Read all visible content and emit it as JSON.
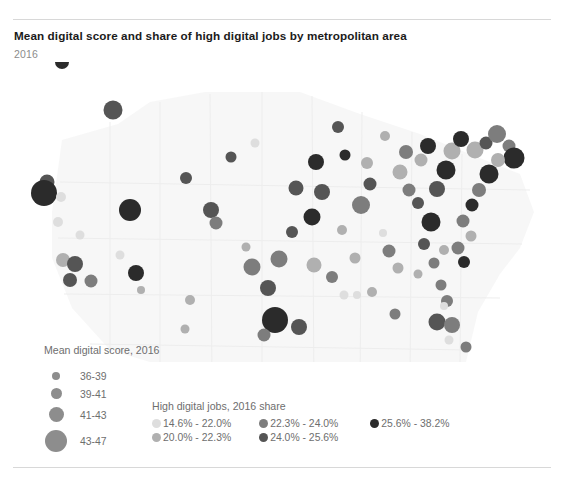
{
  "header": {
    "title": "Mean digital score and share of high digital jobs by metropolitan area",
    "subtitle": "2016"
  },
  "size_legend": {
    "title": "Mean digital score, 2016",
    "items": [
      {
        "label": "36-39",
        "radius": 4.0
      },
      {
        "label": "39-41",
        "radius": 5.5
      },
      {
        "label": "41-43",
        "radius": 7.5
      },
      {
        "label": "43-47",
        "radius": 11.0
      }
    ],
    "swatch_color": "#8d8d8d"
  },
  "color_legend": {
    "title": "High digital jobs, 2016 share",
    "columns": [
      [
        {
          "label": "14.6% - 22.0%",
          "color": "#dedede"
        },
        {
          "label": "20.0% - 22.3%",
          "color": "#b0b0b0"
        }
      ],
      [
        {
          "label": "22.3% - 24.0%",
          "color": "#7d7d7d"
        },
        {
          "label": "24.0% - 25.6%",
          "color": "#555555"
        }
      ],
      [
        {
          "label": "25.6% - 38.2%",
          "color": "#2b2b2b"
        }
      ]
    ]
  },
  "chart_data": {
    "type": "scatter",
    "title": "Mean digital score and share of high digital jobs by metropolitan area",
    "subtitle": "2016",
    "xlabel": "",
    "ylabel": "",
    "grid": false,
    "legend_position": "bottom",
    "projection": "united-states-albers",
    "size_variable": "Mean digital score, 2016",
    "size_bins": [
      "36-39",
      "39-41",
      "41-43",
      "43-47"
    ],
    "color_variable": "High digital jobs, 2016 share",
    "color_bins": [
      "14.6% - 22.0%",
      "20.0% - 22.3%",
      "22.3% - 24.0%",
      "24.0% - 25.6%",
      "25.6% - 38.2%"
    ],
    "color_palette": [
      "#dedede",
      "#b0b0b0",
      "#7d7d7d",
      "#555555",
      "#2b2b2b"
    ],
    "basemap_color": "#f4f4f4",
    "points": [
      {
        "x": 75,
        "y": 36,
        "r": 10.5,
        "c": 4
      },
      {
        "x": 62,
        "y": 62,
        "r": 7.0,
        "c": 4
      },
      {
        "x": 118,
        "y": 45,
        "r": 6.0,
        "c": 0
      },
      {
        "x": 113,
        "y": 110,
        "r": 9.5,
        "c": 3
      },
      {
        "x": 47,
        "y": 182,
        "r": 7.5,
        "c": 3
      },
      {
        "x": 44,
        "y": 193,
        "r": 13.0,
        "c": 4
      },
      {
        "x": 61,
        "y": 197,
        "r": 5.0,
        "c": 0
      },
      {
        "x": 58,
        "y": 222,
        "r": 5.0,
        "c": 0
      },
      {
        "x": 80,
        "y": 235,
        "r": 4.5,
        "c": 0
      },
      {
        "x": 63,
        "y": 260,
        "r": 7.0,
        "c": 1
      },
      {
        "x": 75,
        "y": 264,
        "r": 8.0,
        "c": 3
      },
      {
        "x": 70,
        "y": 280,
        "r": 7.0,
        "c": 3
      },
      {
        "x": 91,
        "y": 281,
        "r": 6.5,
        "c": 2
      },
      {
        "x": 130,
        "y": 210,
        "r": 11.0,
        "c": 4
      },
      {
        "x": 136,
        "y": 273,
        "r": 8.0,
        "c": 4
      },
      {
        "x": 120,
        "y": 255,
        "r": 4.5,
        "c": 0
      },
      {
        "x": 141,
        "y": 290,
        "r": 4.0,
        "c": 1
      },
      {
        "x": 186,
        "y": 178,
        "r": 6.0,
        "c": 3
      },
      {
        "x": 190,
        "y": 300,
        "r": 5.0,
        "c": 1
      },
      {
        "x": 211,
        "y": 210,
        "r": 8.0,
        "c": 3
      },
      {
        "x": 216,
        "y": 223,
        "r": 6.5,
        "c": 2
      },
      {
        "x": 185,
        "y": 329,
        "r": 4.5,
        "c": 1
      },
      {
        "x": 246,
        "y": 247,
        "r": 4.5,
        "c": 1
      },
      {
        "x": 252,
        "y": 267,
        "r": 8.5,
        "c": 2
      },
      {
        "x": 279,
        "y": 259,
        "r": 8.5,
        "c": 2
      },
      {
        "x": 268,
        "y": 288,
        "r": 8.0,
        "c": 3
      },
      {
        "x": 275,
        "y": 320,
        "r": 13.0,
        "c": 4
      },
      {
        "x": 264,
        "y": 335,
        "r": 6.5,
        "c": 2
      },
      {
        "x": 299,
        "y": 327,
        "r": 8.0,
        "c": 3
      },
      {
        "x": 292,
        "y": 232,
        "r": 6.0,
        "c": 3
      },
      {
        "x": 316,
        "y": 162,
        "r": 8.0,
        "c": 4
      },
      {
        "x": 296,
        "y": 188,
        "r": 7.5,
        "c": 3
      },
      {
        "x": 322,
        "y": 192,
        "r": 8.0,
        "c": 3
      },
      {
        "x": 312,
        "y": 217,
        "r": 8.5,
        "c": 4
      },
      {
        "x": 332,
        "y": 277,
        "r": 6.0,
        "c": 2
      },
      {
        "x": 344,
        "y": 295,
        "r": 4.5,
        "c": 0
      },
      {
        "x": 357,
        "y": 295,
        "r": 4.0,
        "c": 0
      },
      {
        "x": 314,
        "y": 265,
        "r": 7.5,
        "c": 1
      },
      {
        "x": 345,
        "y": 155,
        "r": 5.5,
        "c": 4
      },
      {
        "x": 342,
        "y": 230,
        "r": 5.0,
        "c": 1
      },
      {
        "x": 361,
        "y": 205,
        "r": 9.0,
        "c": 2
      },
      {
        "x": 370,
        "y": 184,
        "r": 6.5,
        "c": 3
      },
      {
        "x": 367,
        "y": 163,
        "r": 6.0,
        "c": 1
      },
      {
        "x": 383,
        "y": 233,
        "r": 4.0,
        "c": 0
      },
      {
        "x": 389,
        "y": 251,
        "r": 6.5,
        "c": 2
      },
      {
        "x": 398,
        "y": 268,
        "r": 5.5,
        "c": 1
      },
      {
        "x": 372,
        "y": 292,
        "r": 5.0,
        "c": 1
      },
      {
        "x": 395,
        "y": 314,
        "r": 5.5,
        "c": 2
      },
      {
        "x": 400,
        "y": 172,
        "r": 7.5,
        "c": 1
      },
      {
        "x": 409,
        "y": 190,
        "r": 6.5,
        "c": 2
      },
      {
        "x": 406,
        "y": 152,
        "r": 7.0,
        "c": 2
      },
      {
        "x": 421,
        "y": 160,
        "r": 6.5,
        "c": 1
      },
      {
        "x": 428,
        "y": 146,
        "r": 8.0,
        "c": 4
      },
      {
        "x": 418,
        "y": 203,
        "r": 6.0,
        "c": 3
      },
      {
        "x": 431,
        "y": 222,
        "r": 9.5,
        "c": 4
      },
      {
        "x": 437,
        "y": 189,
        "r": 8.0,
        "c": 3
      },
      {
        "x": 446,
        "y": 170,
        "r": 9.5,
        "c": 4
      },
      {
        "x": 452,
        "y": 151,
        "r": 8.5,
        "c": 1
      },
      {
        "x": 461,
        "y": 139,
        "r": 8.0,
        "c": 4
      },
      {
        "x": 475,
        "y": 150,
        "r": 8.5,
        "c": 1
      },
      {
        "x": 486,
        "y": 143,
        "r": 6.5,
        "c": 3
      },
      {
        "x": 497,
        "y": 134,
        "r": 9.0,
        "c": 2
      },
      {
        "x": 509,
        "y": 146,
        "r": 6.5,
        "c": 2
      },
      {
        "x": 514,
        "y": 158,
        "r": 10.5,
        "c": 4
      },
      {
        "x": 498,
        "y": 160,
        "r": 7.0,
        "c": 1
      },
      {
        "x": 489,
        "y": 174,
        "r": 9.5,
        "c": 4
      },
      {
        "x": 479,
        "y": 190,
        "r": 7.0,
        "c": 2
      },
      {
        "x": 472,
        "y": 205,
        "r": 6.5,
        "c": 4
      },
      {
        "x": 463,
        "y": 221,
        "r": 6.5,
        "c": 2
      },
      {
        "x": 471,
        "y": 236,
        "r": 5.5,
        "c": 1
      },
      {
        "x": 458,
        "y": 248,
        "r": 6.5,
        "c": 2
      },
      {
        "x": 464,
        "y": 262,
        "r": 6.0,
        "c": 4
      },
      {
        "x": 444,
        "y": 250,
        "r": 5.0,
        "c": 1
      },
      {
        "x": 434,
        "y": 263,
        "r": 5.5,
        "c": 2
      },
      {
        "x": 424,
        "y": 244,
        "r": 6.0,
        "c": 3
      },
      {
        "x": 441,
        "y": 285,
        "r": 5.5,
        "c": 2
      },
      {
        "x": 447,
        "y": 301,
        "r": 6.0,
        "c": 2
      },
      {
        "x": 437,
        "y": 322,
        "r": 8.5,
        "c": 3
      },
      {
        "x": 452,
        "y": 325,
        "r": 8.0,
        "c": 2
      },
      {
        "x": 449,
        "y": 340,
        "r": 4.5,
        "c": 0
      },
      {
        "x": 466,
        "y": 347,
        "r": 5.5,
        "c": 2
      },
      {
        "x": 444,
        "y": 306,
        "r": 4.0,
        "c": 0
      },
      {
        "x": 418,
        "y": 274,
        "r": 4.5,
        "c": 1
      },
      {
        "x": 355,
        "y": 258,
        "r": 5.5,
        "c": 1
      },
      {
        "x": 231,
        "y": 157,
        "r": 5.5,
        "c": 3
      },
      {
        "x": 255,
        "y": 143,
        "r": 4.5,
        "c": 0
      },
      {
        "x": 338,
        "y": 127,
        "r": 6.0,
        "c": 3
      },
      {
        "x": 385,
        "y": 136,
        "r": 5.0,
        "c": 1
      }
    ]
  }
}
